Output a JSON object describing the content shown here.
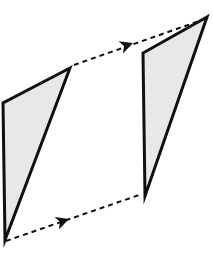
{
  "figure": {
    "canvas": {
      "width": 213,
      "height": 262,
      "background": "#ffffff"
    },
    "style": {
      "shape_fill": "#e8e8e8",
      "shape_stroke": "#101010",
      "shape_stroke_width": 3,
      "arrow_color": "#101010",
      "arrow_stroke_width": 2,
      "dash_pattern": "5,4"
    },
    "shapes": [
      {
        "name": "source-triangle",
        "role": "pre-image",
        "points": "70,68 3,103 5,240",
        "vertices": [
          {
            "label": "apex",
            "x": 70,
            "y": 68
          },
          {
            "label": "top-left",
            "x": 3,
            "y": 103
          },
          {
            "label": "bottom-left",
            "x": 5,
            "y": 240
          }
        ]
      },
      {
        "name": "image-triangle",
        "role": "image",
        "points": "207,17 143,53 145,196",
        "vertices": [
          {
            "label": "apex",
            "x": 207,
            "y": 17
          },
          {
            "label": "top-left",
            "x": 143,
            "y": 53
          },
          {
            "label": "bottom-left",
            "x": 145,
            "y": 196
          }
        ]
      }
    ],
    "arrows": [
      {
        "name": "top-translation-arrow",
        "from": {
          "x": 74,
          "y": 65
        },
        "to": {
          "x": 205,
          "y": 19
        },
        "arrowhead": {
          "x": 133,
          "y": 43,
          "angle": -19.5
        },
        "style": "dashed"
      },
      {
        "name": "bottom-translation-arrow",
        "from": {
          "x": 6,
          "y": 241
        },
        "to": {
          "x": 142,
          "y": 194
        },
        "arrowhead": {
          "x": 69,
          "y": 219,
          "angle": -19.0
        },
        "style": "dashed"
      }
    ]
  }
}
